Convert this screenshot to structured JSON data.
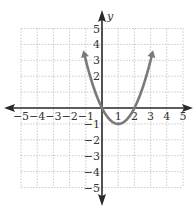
{
  "chart_data": {
    "type": "line",
    "title": "",
    "xlabel": "",
    "ylabel": "y",
    "xlim": [
      -5,
      5
    ],
    "ylim": [
      -5,
      5
    ],
    "grid": true,
    "x_ticks": [
      "-5",
      "-4",
      "-3",
      "-2",
      "-1",
      "1",
      "2",
      "3",
      "4",
      "5"
    ],
    "y_ticks": [
      "5",
      "4",
      "3",
      "2",
      "-1",
      "-2",
      "-3",
      "-4",
      "-5"
    ],
    "series": [
      {
        "name": "parabola",
        "equation": "y = x^2 - 2x",
        "vertex": [
          1,
          -1
        ],
        "x_intercepts": [
          0,
          2
        ],
        "x": [
          -1.2,
          -1,
          0,
          1,
          2,
          3,
          3.2
        ],
        "y": [
          3.84,
          3,
          0,
          -1,
          0,
          3,
          3.84
        ],
        "color": "#7a7a7a"
      }
    ]
  },
  "colors": {
    "axis": "#2a2a2a",
    "grid": "#bdbdbd",
    "curve": "#7a7a7a"
  }
}
